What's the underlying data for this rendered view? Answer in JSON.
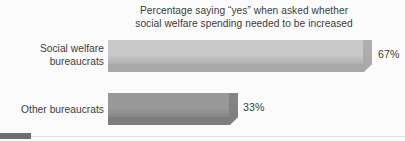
{
  "chart_data": {
    "type": "bar",
    "orientation": "horizontal",
    "title": "Percentage saying “yes” when asked whether\nsocial welfare spending needed to be increased",
    "subtitle": "",
    "xlabel": "",
    "ylabel": "",
    "xlim": [
      0,
      100
    ],
    "grid": false,
    "legend": false,
    "categories": [
      "Social welfare\nbureaucrats",
      "Other bureaucrats"
    ],
    "values": [
      67,
      33
    ],
    "value_labels": [
      "67%",
      "33%"
    ],
    "bar_colors": [
      "#c9c9c9",
      "#999999"
    ],
    "bar_shadow_colors": [
      "#a8a8a8",
      "#7d7d7d"
    ],
    "bar_wedge_colors": [
      "#b0b0b0",
      "#868686"
    ],
    "text_color": "#3b3b3b",
    "background_color": "#fbfbfb"
  },
  "chart": {
    "title": "Percentage saying “yes” when asked whether\nsocial welfare spending needed to be increased",
    "bars": [
      {
        "label": "Social welfare\nbureaucrats",
        "value_label": "67%"
      },
      {
        "label": "Other bureaucrats",
        "value_label": "33%"
      }
    ]
  },
  "decor": {
    "corner_mark_color": "#6e6e6e",
    "baseline_color": "#e2e2e2"
  }
}
